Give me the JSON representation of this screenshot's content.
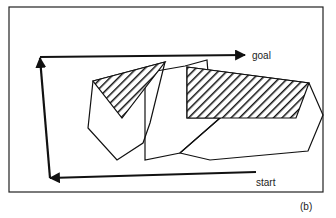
{
  "figure": {
    "panel_label": "(b)",
    "labels": {
      "goal": "goal",
      "start": "start"
    },
    "elements": {
      "frame": "rectangular workspace boundary",
      "obstacles": [
        "left polygon obstacle",
        "center polygon obstacle",
        "right polygon obstacle"
      ],
      "hatched_regions": [
        "left hatched triangular region",
        "right hatched region"
      ],
      "path": "arrowed path from start going left, up, then right to goal"
    },
    "colors": {
      "stroke": "#111111",
      "background": "#ffffff"
    }
  }
}
